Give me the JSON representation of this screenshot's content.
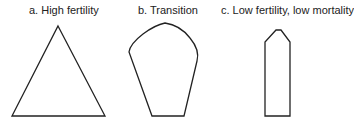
{
  "diagram": {
    "panels": [
      {
        "label": "a. High fertility",
        "shape": "triangle"
      },
      {
        "label": "b. Transition",
        "shape": "rounded-bell"
      },
      {
        "label": "c. Low fertility, low mortality",
        "shape": "column"
      }
    ]
  }
}
